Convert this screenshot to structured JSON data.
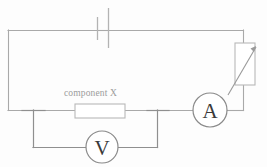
{
  "diagram": {
    "background_color": "#fdfdfd",
    "wire_color": "#a9a9a9",
    "label_color": "#9c9c9c",
    "meter_text_color": "#3a3a3a"
  },
  "labels": {
    "component_x": "component X"
  },
  "meters": {
    "ammeter": {
      "symbol": "A",
      "name": "ammeter",
      "center_x": 210,
      "center_y": 110,
      "radius": 17
    },
    "voltmeter": {
      "symbol": "V",
      "name": "voltmeter",
      "center_x": 102,
      "center_y": 147,
      "radius": 16
    }
  },
  "components": {
    "cell": {
      "name": "cell",
      "short_plate_x": 97,
      "short_plate_y1": 17,
      "short_plate_y2": 40,
      "long_plate_x": 108,
      "long_plate_y1": 8,
      "long_plate_y2": 48
    },
    "component_x_box": {
      "name": "component-x-resistor",
      "x": 75,
      "y": 104,
      "width": 50,
      "height": 14
    },
    "variable_resistor": {
      "name": "variable-resistor",
      "x": 235,
      "y": 43,
      "width": 20,
      "height": 42
    }
  },
  "geometry": {
    "loop_left_x": 8,
    "loop_right_x": 243,
    "loop_top_y": 30,
    "loop_bottom_y": 110,
    "voltmeter_branch_left_x": 33,
    "voltmeter_branch_right_x": 157,
    "voltmeter_branch_y": 147
  }
}
